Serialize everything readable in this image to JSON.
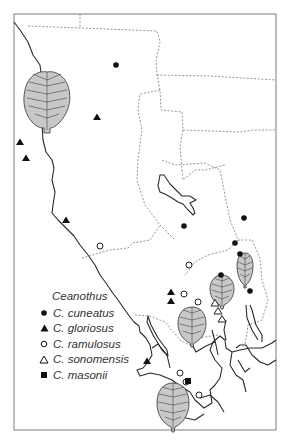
{
  "legend": {
    "title": "Ceanothus",
    "items": [
      {
        "symbol": "filled-circle",
        "label": "C. cuneatus"
      },
      {
        "symbol": "filled-triangle",
        "label": "C. gloriosus"
      },
      {
        "symbol": "open-circle",
        "label": "C. ramulosus"
      },
      {
        "symbol": "open-triangle",
        "label": "C. sonomensis"
      },
      {
        "symbol": "filled-square",
        "label": "C. masonii"
      }
    ]
  },
  "points": {
    "cuneatus": [
      [
        116,
        65
      ],
      [
        244,
        218
      ],
      [
        184,
        226
      ],
      [
        235,
        243
      ],
      [
        240,
        254
      ],
      [
        221,
        275
      ],
      [
        250,
        291
      ]
    ],
    "gloriosus": [
      [
        97,
        117
      ],
      [
        20,
        142
      ],
      [
        26,
        158
      ],
      [
        66,
        220
      ],
      [
        171,
        292
      ],
      [
        171,
        301
      ],
      [
        147,
        361
      ]
    ],
    "ramulosus": [
      [
        100,
        246
      ],
      [
        189,
        265
      ],
      [
        184,
        294
      ],
      [
        198,
        302
      ],
      [
        180,
        373
      ],
      [
        186,
        382
      ],
      [
        199,
        395
      ]
    ],
    "sonomensis": [
      [
        215,
        303
      ],
      [
        218,
        311
      ],
      [
        222,
        319
      ]
    ],
    "masonii": [
      [
        188,
        381
      ]
    ]
  },
  "colors": {
    "frame": "#9a9a9a",
    "county": "#8a8a8a",
    "coast": "#2a2a2a",
    "leaf": "#c8c8c8"
  }
}
